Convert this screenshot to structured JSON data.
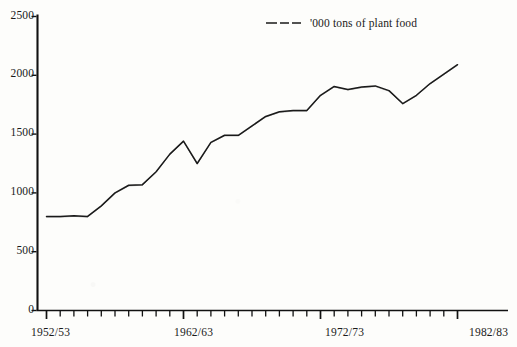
{
  "figure": {
    "background_color": "#fdfdfb",
    "line_color": "#1a1a1a",
    "axis_color": "#111111"
  },
  "legend": {
    "position": "top-center",
    "swatch_icon": "dashed-line-icon",
    "label": "'000 tons of plant food"
  },
  "y_axis": {
    "ticks": [
      "0",
      "500",
      "1000",
      "1500",
      "2000",
      "2500"
    ],
    "min": 0,
    "max": 2500,
    "step": 500
  },
  "x_axis": {
    "labels": [
      "1952/53",
      "1962/63",
      "1972/73",
      "1982/83"
    ],
    "label_positions": [
      0,
      10,
      20,
      30
    ],
    "tick_count": 31
  },
  "chart_data": {
    "type": "line",
    "title": "",
    "subtitle": "",
    "xlabel": "",
    "ylabel": "",
    "ylim": [
      0,
      2500
    ],
    "grid": false,
    "legend_position": "top-center",
    "categories": [
      "1952/53",
      "1953/54",
      "1954/55",
      "1955/56",
      "1956/57",
      "1957/58",
      "1958/59",
      "1959/60",
      "1960/61",
      "1961/62",
      "1962/63",
      "1963/64",
      "1964/65",
      "1965/66",
      "1966/67",
      "1967/68",
      "1968/69",
      "1969/70",
      "1970/71",
      "1971/72",
      "1972/73",
      "1973/74",
      "1974/75",
      "1975/76",
      "1976/77",
      "1977/78",
      "1978/79",
      "1979/80",
      "1980/81",
      "1981/82",
      "1982/83"
    ],
    "series": [
      {
        "name": "'000 tons of plant food",
        "values": [
          800,
          800,
          805,
          800,
          890,
          1000,
          1065,
          1070,
          1180,
          1330,
          1440,
          1250,
          1430,
          1490,
          1490,
          1570,
          1650,
          1690,
          1700,
          1700,
          1830,
          1905,
          1880,
          1900,
          1910,
          1870,
          1760,
          1830,
          1930,
          2010,
          2090
        ]
      }
    ]
  }
}
